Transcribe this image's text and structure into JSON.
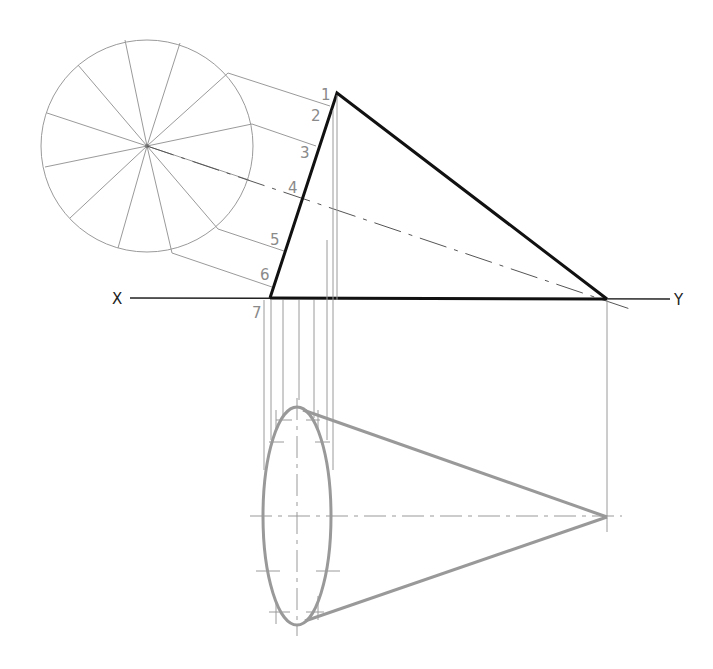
{
  "drawing": {
    "type": "orthographic projection of an inclined cone",
    "reference_line": {
      "left_label": "X",
      "right_label": "Y"
    },
    "point_labels": [
      "1",
      "2",
      "3",
      "4",
      "5",
      "6",
      "7"
    ],
    "auxiliary_circle_divisions": 12,
    "colors": {
      "outline": "#111111",
      "construction": "#9a9a9a",
      "plan_view": "#999999"
    }
  }
}
